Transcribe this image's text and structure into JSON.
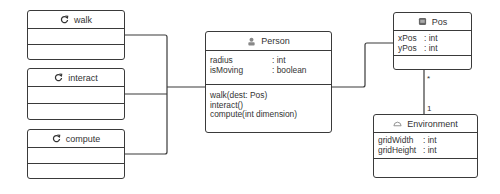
{
  "diagram": {
    "type": "UML class diagram",
    "classes": [
      {
        "id": "walk",
        "name": "walk",
        "icon": "refresh-icon",
        "attributes": [],
        "methods": []
      },
      {
        "id": "interact",
        "name": "interact",
        "icon": "refresh-icon",
        "attributes": [],
        "methods": []
      },
      {
        "id": "compute",
        "name": "compute",
        "icon": "refresh-icon",
        "attributes": [],
        "methods": []
      },
      {
        "id": "person",
        "name": "Person",
        "icon": "person-icon",
        "attributes": [
          {
            "name": "radius",
            "type": ": int"
          },
          {
            "name": "isMoving",
            "type": ": boolean"
          }
        ],
        "methods": [
          "walk(dest: Pos)",
          "interact()",
          "compute(int dimension)"
        ]
      },
      {
        "id": "pos",
        "name": "Pos",
        "icon": "square-icon",
        "attributes": [
          {
            "name": "xPos",
            "type": ": int"
          },
          {
            "name": "yPos",
            "type": ": int"
          }
        ],
        "methods": []
      },
      {
        "id": "environment",
        "name": "Environment",
        "icon": "cloud-icon",
        "attributes": [
          {
            "name": "gridWidth",
            "type": ": int"
          },
          {
            "name": "gridHeight",
            "type": ": int"
          }
        ],
        "methods": []
      }
    ],
    "relations": [
      {
        "from": "walk",
        "to": "person"
      },
      {
        "from": "interact",
        "to": "person"
      },
      {
        "from": "compute",
        "to": "person"
      },
      {
        "from": "person",
        "to": "pos"
      },
      {
        "from": "pos",
        "to": "environment",
        "from_multiplicity": "*",
        "to_multiplicity": "1"
      }
    ]
  }
}
